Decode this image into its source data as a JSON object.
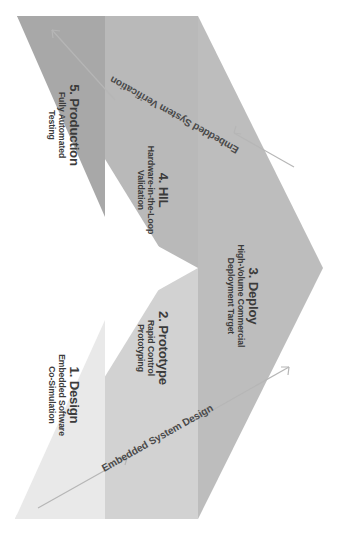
{
  "diagram": {
    "type": "v-model",
    "orientation": "rotated-90-clockwise",
    "background_color": "#ffffff",
    "apex": {
      "x": 323,
      "y": 268
    },
    "top_left": {
      "x": 17,
      "y": 16
    },
    "bottom_left": {
      "x": 15,
      "y": 519
    },
    "notch_tip": {
      "x": 172,
      "y": 268
    },
    "stages": [
      {
        "id": "design",
        "number": "1.",
        "title": "1. Design",
        "subtitle_line1": "Embedded Software",
        "subtitle_line2": "Co-Simulation",
        "band": "lower-1",
        "fill": "#e9e9e9",
        "label_x": 66,
        "label_y": 393
      },
      {
        "id": "prototype",
        "number": "2.",
        "title": "2. Prototype",
        "subtitle_line1": "Rapid Control",
        "subtitle_line2": "Prototyping",
        "band": "lower-2",
        "fill": "#d2d2d2",
        "label_x": 155,
        "label_y": 348
      },
      {
        "id": "deploy",
        "number": "3.",
        "title": "3. Deploy",
        "subtitle_line1": "High-Volume Commercial",
        "subtitle_line2": "Deployment Target",
        "band": "apex",
        "fill": "#bdbdbd",
        "label_x": 243,
        "label_y": 295
      },
      {
        "id": "hil",
        "number": "4.",
        "title": "4. HIL",
        "subtitle_line1": "Hardware-in-the-Loop",
        "subtitle_line2": "Validation",
        "band": "upper-2",
        "fill": "#b9b9b9",
        "label_x": 155,
        "label_y": 188
      },
      {
        "id": "production",
        "number": "5.",
        "title": "5. Production",
        "subtitle_line1": "Fully Automated",
        "subtitle_line2": "Testing",
        "band": "upper-1",
        "fill": "#a8a8a8",
        "label_x": 66,
        "label_y": 125
      }
    ],
    "axes": [
      {
        "id": "design-axis",
        "label": "Embedded System Design",
        "direction": "toward-apex",
        "label_x": 171,
        "label_y": 418,
        "rotation": -29.5,
        "color": "#b6b6b6"
      },
      {
        "id": "verification-axis",
        "label": "Embedded System Verification",
        "direction": "away-from-apex",
        "label_x": 171,
        "label_y": 118,
        "rotation": 29.5,
        "color": "#b6b6b6"
      }
    ],
    "colors": {
      "background": "#ffffff",
      "notch": "#ffffff",
      "text": "#3b3b3b",
      "axis": "#b6b6b6",
      "band_design": "#e9e9e9",
      "band_prototype": "#d2d2d2",
      "band_deploy": "#bdbdbd",
      "band_hil": "#b9b9b9",
      "band_production": "#a8a8a8"
    }
  }
}
